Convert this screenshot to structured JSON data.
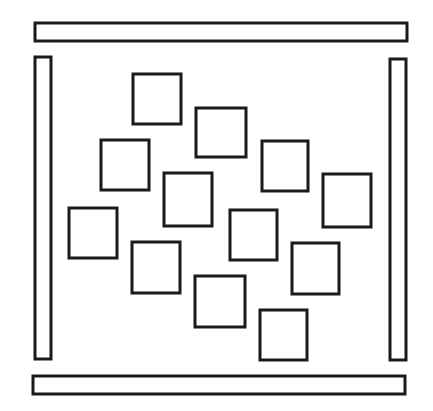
{
  "diagram": {
    "stroke_color": "#1a1a1a",
    "background": "#ffffff",
    "walls": [
      {
        "name": "top-wall",
        "x": 35,
        "y": 23,
        "w": 372,
        "h": 18
      },
      {
        "name": "left-wall",
        "x": 35,
        "y": 57,
        "w": 16,
        "h": 302
      },
      {
        "name": "right-wall",
        "x": 390,
        "y": 59,
        "w": 16,
        "h": 301
      },
      {
        "name": "bottom-wall",
        "x": 33,
        "y": 376,
        "w": 372,
        "h": 18
      }
    ],
    "particles": [
      {
        "x": 133,
        "y": 74,
        "w": 48,
        "h": 50
      },
      {
        "x": 196,
        "y": 108,
        "w": 50,
        "h": 49
      },
      {
        "x": 101,
        "y": 140,
        "w": 48,
        "h": 50
      },
      {
        "x": 262,
        "y": 141,
        "w": 46,
        "h": 50
      },
      {
        "x": 164,
        "y": 173,
        "w": 48,
        "h": 53
      },
      {
        "x": 323,
        "y": 174,
        "w": 48,
        "h": 53
      },
      {
        "x": 69,
        "y": 208,
        "w": 48,
        "h": 50
      },
      {
        "x": 230,
        "y": 210,
        "w": 47,
        "h": 50
      },
      {
        "x": 132,
        "y": 242,
        "w": 48,
        "h": 51
      },
      {
        "x": 292,
        "y": 243,
        "w": 47,
        "h": 51
      },
      {
        "x": 195,
        "y": 276,
        "w": 50,
        "h": 51
      },
      {
        "x": 260,
        "y": 310,
        "w": 47,
        "h": 50
      }
    ]
  }
}
